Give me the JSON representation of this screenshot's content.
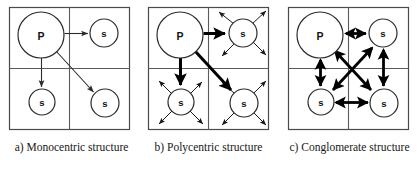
{
  "figure": {
    "background_color": "#ffffff",
    "line_color": "#2b2b2b",
    "node_fill": "#ffffff",
    "panel_count": 3
  },
  "panels": [
    {
      "id": "a",
      "caption": "a) Monocentric structure",
      "quadrant_box": {
        "x": 9,
        "y": 7,
        "width": 121,
        "height": 123
      },
      "nodes": [
        {
          "name": "primary-center",
          "label": "P",
          "cx": 41,
          "cy": 35,
          "r": 23,
          "type": "primary"
        },
        {
          "name": "sub-center-top-right",
          "label": "s",
          "cx": 104,
          "cy": 33,
          "r": 14,
          "type": "sub"
        },
        {
          "name": "sub-center-bottom-left",
          "label": "s",
          "cx": 42,
          "cy": 102,
          "r": 13,
          "type": "sub"
        },
        {
          "name": "sub-center-bottom-right",
          "label": "s",
          "cx": 105,
          "cy": 103,
          "r": 14,
          "type": "sub"
        }
      ],
      "arrows": {
        "style": "thin-single-headed",
        "description": "Three thin one-way arrows radiate from the primary center P to each of the three sub-centers s.",
        "links": [
          {
            "from": "P",
            "to": "s-top-right",
            "direction": "one-way"
          },
          {
            "from": "P",
            "to": "s-bottom-left",
            "direction": "one-way"
          },
          {
            "from": "P",
            "to": "s-bottom-right",
            "direction": "one-way"
          }
        ]
      }
    },
    {
      "id": "b",
      "caption": "b) Polycentric structure",
      "quadrant_box": {
        "x": 9,
        "y": 7,
        "width": 121,
        "height": 123
      },
      "nodes": [
        {
          "name": "primary-center",
          "label": "P",
          "cx": 41,
          "cy": 35,
          "r": 23,
          "type": "primary"
        },
        {
          "name": "sub-center-top-right",
          "label": "s",
          "cx": 104,
          "cy": 33,
          "r": 14,
          "type": "sub"
        },
        {
          "name": "sub-center-bottom-left",
          "label": "s",
          "cx": 42,
          "cy": 102,
          "r": 13,
          "type": "sub"
        },
        {
          "name": "sub-center-bottom-right",
          "label": "s",
          "cx": 105,
          "cy": 103,
          "r": 14,
          "type": "sub"
        }
      ],
      "arrows": {
        "style": "thick-single-headed-plus-thin-radiating",
        "description": "Thick one-way arrows run from P to each sub-center; each sub-center additionally emits thin arrows radiating outward to its surroundings.",
        "links": [
          {
            "from": "P",
            "to": "s-top-right",
            "direction": "one-way",
            "weight": "thick"
          },
          {
            "from": "P",
            "to": "s-bottom-left",
            "direction": "one-way",
            "weight": "thick"
          },
          {
            "from": "P",
            "to": "s-bottom-right",
            "direction": "one-way",
            "weight": "thick"
          }
        ],
        "radiating_from": [
          "s-top-right",
          "s-bottom-left",
          "s-bottom-right"
        ]
      }
    },
    {
      "id": "c",
      "caption": "c) Conglomerate structure",
      "quadrant_box": {
        "x": 9,
        "y": 7,
        "width": 121,
        "height": 123
      },
      "nodes": [
        {
          "name": "primary-center",
          "label": "P",
          "cx": 41,
          "cy": 35,
          "r": 23,
          "type": "primary"
        },
        {
          "name": "sub-center-top-right",
          "label": "s",
          "cx": 104,
          "cy": 33,
          "r": 14,
          "type": "sub"
        },
        {
          "name": "sub-center-bottom-left",
          "label": "s",
          "cx": 42,
          "cy": 102,
          "r": 13,
          "type": "sub"
        },
        {
          "name": "sub-center-bottom-right",
          "label": "s",
          "cx": 105,
          "cy": 103,
          "r": 14,
          "type": "sub"
        }
      ],
      "arrows": {
        "style": "thick-double-headed",
        "description": "Every node is linked to every other node by thick two-way arrows: horizontal, vertical and both diagonals crossing in the centre.",
        "links": [
          {
            "from": "P",
            "to": "s-top-right",
            "direction": "two-way"
          },
          {
            "from": "P",
            "to": "s-bottom-left",
            "direction": "two-way"
          },
          {
            "from": "P",
            "to": "s-bottom-right",
            "direction": "two-way"
          },
          {
            "from": "s-top-right",
            "to": "s-bottom-left",
            "direction": "two-way"
          },
          {
            "from": "s-top-right",
            "to": "s-bottom-right",
            "direction": "two-way"
          },
          {
            "from": "s-bottom-left",
            "to": "s-bottom-right",
            "direction": "two-way"
          }
        ]
      }
    }
  ]
}
